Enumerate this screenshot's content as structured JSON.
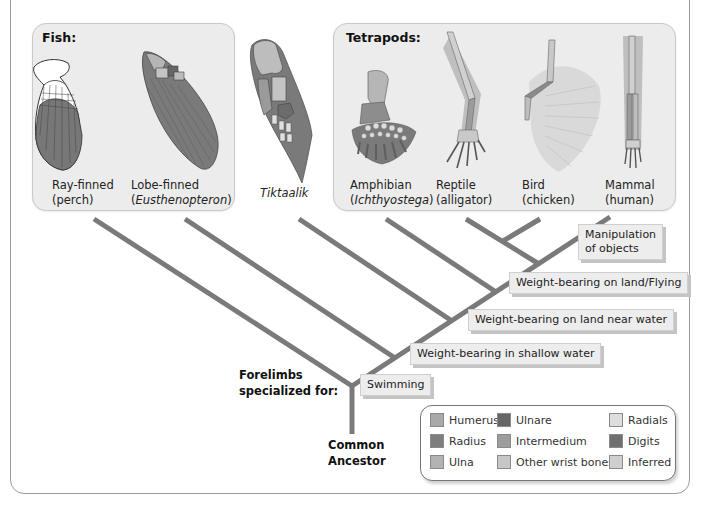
{
  "panels": {
    "fish": {
      "title": "Fish:",
      "organisms": [
        {
          "line1": "Ray-finned",
          "line2": "(perch)"
        },
        {
          "line1": "Lobe-finned",
          "line2_pre": "(",
          "line2_italic": "Eusthenopteron",
          "line2_post": ")"
        }
      ]
    },
    "tiktaalik": {
      "label": "Tiktaalik"
    },
    "tetrapods": {
      "title": "Tetrapods:",
      "organisms": [
        {
          "line1": "Amphibian",
          "line2_pre": "(",
          "line2_italic": "Ichthyostega",
          "line2_post": ")"
        },
        {
          "line1": "Reptile",
          "line2": "(alligator)"
        },
        {
          "line1": "Bird",
          "line2": "(chicken)"
        },
        {
          "line1": "Mammal",
          "line2": "(human)"
        }
      ]
    }
  },
  "tree": {
    "heading_line1": "Forelimbs",
    "heading_line2": "specialized for:",
    "root_line1": "Common",
    "root_line2": "Ancestor",
    "traits": [
      {
        "label": "Swimming"
      },
      {
        "label": "Weight-bearing in shallow water"
      },
      {
        "label": "Weight-bearing on land near water"
      },
      {
        "label": "Weight-bearing on land/Flying"
      },
      {
        "label_line1": "Manipulation",
        "label_line2": "of objects"
      }
    ],
    "branch_color": "#7a7a7a"
  },
  "legend": {
    "items": [
      {
        "label": "Humerus",
        "color": "#a9a9a9"
      },
      {
        "label": "Radius",
        "color": "#7e7e7e"
      },
      {
        "label": "Ulna",
        "color": "#b3b3b3"
      },
      {
        "label": "Ulnare",
        "color": "#666666"
      },
      {
        "label": "Intermedium",
        "color": "#9d9d9d"
      },
      {
        "label": "Other wrist bones",
        "color": "#c6c6c6"
      },
      {
        "label": "Radials",
        "color": "#dddddd"
      },
      {
        "label": "Digits",
        "color": "#6f6f6f"
      },
      {
        "label": "Inferred",
        "color": "#cfcfcf"
      }
    ]
  }
}
